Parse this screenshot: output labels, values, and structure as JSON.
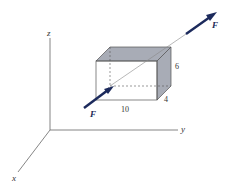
{
  "diagram": {
    "axes": {
      "x_label": "x",
      "y_label": "y",
      "z_label": "z"
    },
    "box": {
      "length_label": "10",
      "height_label": "6",
      "depth_label": "4"
    },
    "force": {
      "label_tail": "F",
      "label_head": "F"
    },
    "colors": {
      "arrow": "#1c2a5c",
      "shade": "#a8acb6",
      "line": "#555555"
    }
  }
}
